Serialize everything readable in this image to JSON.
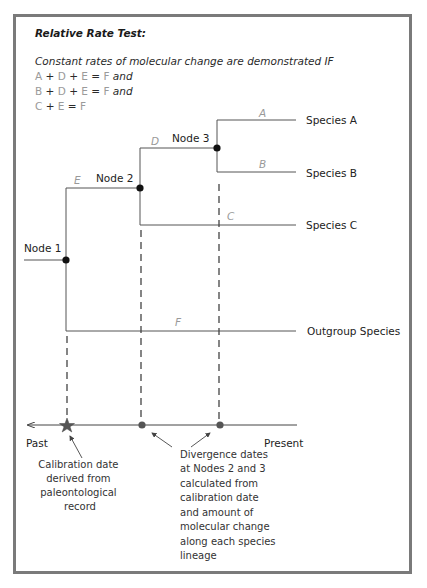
{
  "title": "Relative Rate Test:",
  "condition": {
    "intro": "Constant rates of molecular change are demonstrated IF",
    "equations": [
      {
        "terms": [
          "A",
          "D",
          "E"
        ],
        "result": "F",
        "suffix": "and"
      },
      {
        "terms": [
          "B",
          "D",
          "E"
        ],
        "result": "F",
        "suffix": "and"
      },
      {
        "terms": [
          "C",
          "E"
        ],
        "result": "F",
        "suffix": ""
      }
    ],
    "plus": "+",
    "equals": "="
  },
  "tree": {
    "nodes": [
      {
        "id": "node1",
        "label": "Node 1"
      },
      {
        "id": "node2",
        "label": "Node 2"
      },
      {
        "id": "node3",
        "label": "Node 3"
      }
    ],
    "branches": [
      "A",
      "B",
      "C",
      "D",
      "E",
      "F"
    ],
    "species": [
      {
        "id": "a",
        "label": "Species A"
      },
      {
        "id": "b",
        "label": "Species B"
      },
      {
        "id": "c",
        "label": "Species C"
      },
      {
        "id": "outgroup",
        "label": "Outgroup Species"
      }
    ]
  },
  "timeline": {
    "past_label": "Past",
    "present_label": "Present",
    "calibration_note": [
      "Calibration date",
      "derived from",
      "paleontological",
      "record"
    ],
    "divergence_note": [
      "Divergence dates",
      "at Nodes 2 and 3",
      "calculated from",
      "calibration date",
      "and amount of",
      "molecular change",
      "along each species",
      "lineage"
    ]
  },
  "colors": {
    "frame": "#7a7a7a",
    "line": "#555555",
    "node": "#111111",
    "timeline_marker": "#555555",
    "branch_label": "#999999"
  }
}
